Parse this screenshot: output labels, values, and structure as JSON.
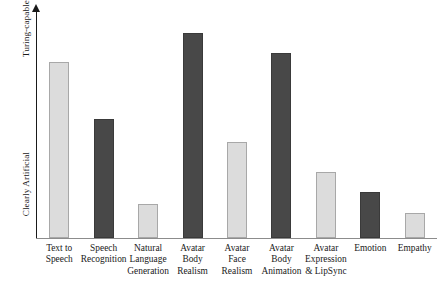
{
  "chart_data": {
    "type": "bar",
    "title": "",
    "subtitle": "",
    "xlabel": "",
    "ylabel": "",
    "grid": false,
    "legend": "none",
    "y_axis": {
      "top_label": "Turing-capable",
      "bottom_label": "Clearly Artificial",
      "ticks": [],
      "ylim": [
        0,
        1
      ],
      "arrow": true,
      "note": "Qualitative ordinal axis from 'Clearly Artificial' (bottom) to 'Turing-capable' (top); no numeric ticks shown."
    },
    "categories": [
      "Text to Speech",
      "Speech Recognition",
      "Natural Language Generation",
      "Avatar Body Realism",
      "Avatar Face Realism",
      "Avatar Body Animation",
      "Avatar Expression & LipSync",
      "Emotion",
      "Empathy"
    ],
    "category_lines": [
      [
        "Text to",
        "Speech"
      ],
      [
        "Speech",
        "Recognition"
      ],
      [
        "Natural",
        "Language",
        "Generation"
      ],
      [
        "Avatar",
        "Body",
        "Realism"
      ],
      [
        "Avatar",
        "Face",
        "Realism"
      ],
      [
        "Avatar",
        "Body",
        "Animation"
      ],
      [
        "Avatar",
        "Expression",
        "& LipSync"
      ],
      [
        "Emotion"
      ],
      [
        "Empathy"
      ]
    ],
    "values": [
      0.77,
      0.52,
      0.15,
      0.9,
      0.42,
      0.81,
      0.29,
      0.2,
      0.11
    ],
    "bar_styles": [
      "light",
      "dark",
      "light",
      "dark",
      "light",
      "dark",
      "light",
      "dark",
      "light"
    ],
    "colors": {
      "light_fill": "#dcdcdc",
      "light_stroke": "#a8a8a8",
      "dark_fill": "#484848",
      "dark_stroke": "#3a3a3a",
      "axis": "#1a1a1a",
      "baseline": "#8c8c8c",
      "background": "#ffffff"
    }
  }
}
